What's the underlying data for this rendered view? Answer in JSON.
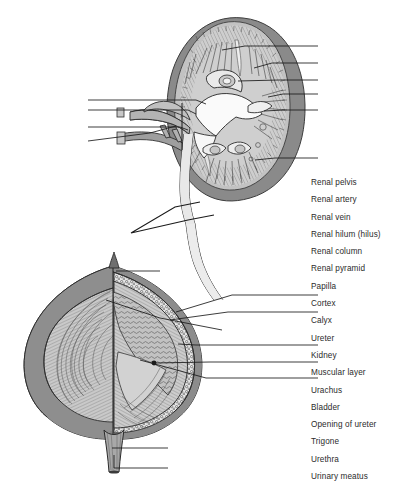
{
  "figure": {
    "background_color": "#ffffff",
    "line_color": "#1a1a1a",
    "colors": {
      "outer_capsule": "#8a8a8a",
      "medium_gray": "#a5a5a5",
      "cortex_light": "#c8c8c8",
      "interior_pale": "#d9d9d9",
      "highlight_white": "#f2f2f2",
      "striation": "#4a4a4a",
      "text": "#2b2b2b"
    },
    "parts": [
      {
        "name": "kidney-cross-section",
        "caption": "Kidney in coronal section showing cortex, medulla, pyramids and pelvis"
      },
      {
        "name": "ureter-break-marker",
        "caption": "Zigzag break symbol indicating shortened ureter"
      },
      {
        "name": "bladder-cross-section",
        "caption": "Urinary bladder cut away showing muscular layer, trigone and urethra"
      }
    ]
  },
  "labels": {
    "heading": "Structures",
    "items": [
      {
        "id": "renal-pelvis",
        "text": "Renal pelvis"
      },
      {
        "id": "renal-artery",
        "text": "Renal artery"
      },
      {
        "id": "renal-vein",
        "text": "Renal vein"
      },
      {
        "id": "renal-hilum",
        "text": "Renal hilum (hilus)"
      },
      {
        "id": "renal-column",
        "text": "Renal column"
      },
      {
        "id": "renal-pyramid",
        "text": "Renal pyramid"
      },
      {
        "id": "papilla",
        "text": "Papilla"
      },
      {
        "id": "cortex",
        "text": "Cortex"
      },
      {
        "id": "calyx",
        "text": "Calyx"
      },
      {
        "id": "ureter",
        "text": "Ureter"
      },
      {
        "id": "kidney",
        "text": "Kidney"
      },
      {
        "id": "muscular-layer",
        "text": "Muscular layer"
      },
      {
        "id": "urachus",
        "text": "Urachus"
      },
      {
        "id": "bladder",
        "text": "Bladder"
      },
      {
        "id": "opening-of-ureter",
        "text": "Opening of ureter"
      },
      {
        "id": "trigone",
        "text": "Trigone"
      },
      {
        "id": "urethra",
        "text": "Urethra"
      },
      {
        "id": "urinary-meatus",
        "text": "Urinary meatus"
      }
    ]
  }
}
